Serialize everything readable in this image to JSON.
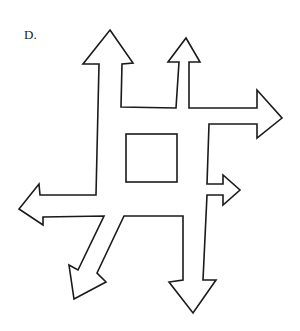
{
  "figure": {
    "label": "D.",
    "stroke_color": "#1a1a1a",
    "fill_color": "#ffffff",
    "arrows": [
      {
        "direction": "up",
        "position": "top-left"
      },
      {
        "direction": "up",
        "position": "top-right"
      },
      {
        "direction": "right",
        "position": "upper-right"
      },
      {
        "direction": "right",
        "position": "lower-right"
      },
      {
        "direction": "down",
        "position": "bottom-right"
      },
      {
        "direction": "down-left",
        "position": "bottom-left"
      },
      {
        "direction": "left",
        "position": "lower-left"
      }
    ],
    "center_shape": "square"
  }
}
